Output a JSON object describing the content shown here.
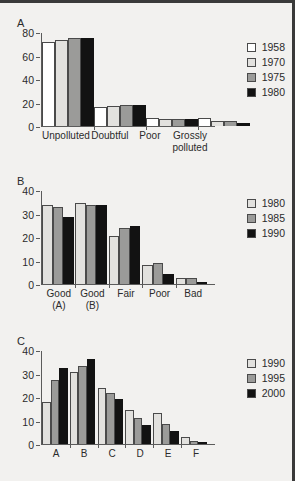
{
  "figure": {
    "background": "#f2f1ef",
    "border_color": "#3a3a3a",
    "palette": [
      "#ffffff",
      "#e2e1de",
      "#9b9b99",
      "#121212"
    ]
  },
  "panels": [
    {
      "letter": "A"
    },
    {
      "letter": "B"
    },
    {
      "letter": "C"
    }
  ],
  "chart_data": [
    {
      "type": "bar",
      "title": "A",
      "categories": [
        "Unpolluted",
        "Doubtful",
        "Poor",
        "Grossly polluted"
      ],
      "series": [
        {
          "name": "1958",
          "color": "#ffffff",
          "values": [
            72,
            16,
            7,
            7
          ]
        },
        {
          "name": "1970",
          "color": "#e2e1de",
          "values": [
            74,
            17.5,
            6,
            4.5
          ]
        },
        {
          "name": "1975",
          "color": "#9b9b99",
          "values": [
            76,
            18.5,
            6,
            4
          ]
        },
        {
          "name": "2000",
          "color": "#121212",
          "values": [
            76,
            18.5,
            6,
            2.5
          ]
        }
      ],
      "xlabel": "",
      "ylabel": "",
      "ylim": [
        0,
        80
      ],
      "yticks": [
        0,
        20,
        40,
        60,
        80
      ],
      "grid": false,
      "legend_position": "top-right"
    },
    {
      "type": "bar",
      "title": "B",
      "categories": [
        "Good (A)",
        "Good (B)",
        "Fair",
        "Poor",
        "Bad"
      ],
      "series": [
        {
          "name": "1980",
          "color": "#e2e1de",
          "values": [
            34,
            35,
            20.5,
            8,
            2.5
          ]
        },
        {
          "name": "1985",
          "color": "#9b9b99",
          "values": [
            33,
            34,
            24,
            9,
            2.5
          ]
        },
        {
          "name": "1990",
          "color": "#121212",
          "values": [
            29,
            34,
            25,
            4.5,
            1
          ]
        }
      ],
      "xlabel": "",
      "ylabel": "",
      "ylim": [
        0,
        40
      ],
      "yticks": [
        0,
        10,
        20,
        30,
        40
      ],
      "grid": false,
      "legend_position": "top-right"
    },
    {
      "type": "bar",
      "title": "C",
      "categories": [
        "A",
        "B",
        "C",
        "D",
        "E",
        "F"
      ],
      "series": [
        {
          "name": "1990",
          "color": "#e2e1de",
          "values": [
            18,
            31,
            24,
            14.5,
            13.5,
            3
          ]
        },
        {
          "name": "1995",
          "color": "#9b9b99",
          "values": [
            27.5,
            33.5,
            22,
            11,
            8.5,
            1.5
          ]
        },
        {
          "name": "2000",
          "color": "#121212",
          "values": [
            32.5,
            36.5,
            19.5,
            8,
            5.5,
            1
          ]
        }
      ],
      "xlabel": "",
      "ylabel": "",
      "ylim": [
        0,
        40
      ],
      "yticks": [
        0,
        10,
        20,
        30,
        40
      ],
      "grid": false,
      "legend_position": "top-right"
    }
  ],
  "legend_a": {
    "years": [
      "1958",
      "1970",
      "1975",
      "1980"
    ]
  },
  "legend_b": {
    "years": [
      "1980",
      "1985",
      "1990"
    ]
  },
  "legend_c": {
    "years": [
      "1990",
      "1995",
      "2000"
    ]
  }
}
